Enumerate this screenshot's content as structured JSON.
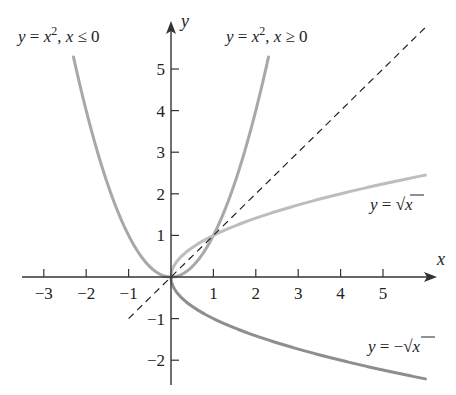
{
  "chart_data": {
    "type": "line",
    "title": "",
    "xlabel": "x",
    "ylabel": "y",
    "xlim": [
      -3.5,
      6.3
    ],
    "ylim": [
      -2.6,
      6.0
    ],
    "x_ticks": [
      -3,
      -2,
      -1,
      1,
      2,
      3,
      4,
      5
    ],
    "y_ticks": [
      -2,
      -1,
      1,
      2,
      3,
      4,
      5
    ],
    "grid": false,
    "legend": "none (inline curve labels)",
    "series": [
      {
        "name": "y = x^2, x ≤ 0",
        "label": "y = x², x ≤ 0",
        "style": "solid",
        "color": "#a8a8a8",
        "x": [
          -2.3,
          -2.0,
          -1.5,
          -1.0,
          -0.5,
          0
        ],
        "values": [
          5.29,
          4.0,
          2.25,
          1.0,
          0.25,
          0
        ]
      },
      {
        "name": "y = x^2, x ≥ 0",
        "label": "y = x², x ≥ 0",
        "style": "solid",
        "color": "#a8a8a8",
        "x": [
          0,
          0.5,
          1.0,
          1.5,
          2.0,
          2.3
        ],
        "values": [
          0,
          0.25,
          1.0,
          2.25,
          4.0,
          5.29
        ]
      },
      {
        "name": "y = sqrt(x)",
        "label": "y = √x",
        "style": "solid",
        "color": "#bdbdbd",
        "x": [
          0,
          0.25,
          1,
          2,
          3,
          4,
          5,
          6
        ],
        "values": [
          0,
          0.5,
          1.0,
          1.41,
          1.73,
          2.0,
          2.24,
          2.45
        ]
      },
      {
        "name": "y = -sqrt(x)",
        "label": "y = −√x",
        "style": "solid",
        "color": "#8e8e8e",
        "x": [
          0,
          0.25,
          1,
          2,
          3,
          4,
          5,
          6
        ],
        "values": [
          0,
          -0.5,
          -1.0,
          -1.41,
          -1.73,
          -2.0,
          -2.24,
          -2.45
        ]
      },
      {
        "name": "y = x",
        "label": "",
        "style": "dashed",
        "color": "#222222",
        "x": [
          -1,
          6
        ],
        "values": [
          -1,
          6
        ]
      }
    ]
  },
  "labels": {
    "x_axis": "x",
    "y_axis": "y",
    "x_ticks": [
      "−3",
      "−2",
      "−1",
      "1",
      "2",
      "3",
      "4",
      "5"
    ],
    "y_ticks": [
      "5",
      "4",
      "3",
      "2",
      "1",
      "−1",
      "−2"
    ],
    "curve_left": {
      "prefix": "y = x",
      "sup": "2",
      "suffix_sep": ", ",
      "cond_var": "x",
      "cond": " ≤ 0"
    },
    "curve_right": {
      "prefix": "y = x",
      "sup": "2",
      "suffix_sep": ", ",
      "cond_var": "x",
      "cond": " ≥ 0"
    },
    "curve_sqrt": {
      "y": "y",
      "eq": " = √",
      "x": "x"
    },
    "curve_neg_sqrt": {
      "y": "y",
      "eq": " = −√",
      "x": "x"
    }
  },
  "colors": {
    "axis": "#333333",
    "parabola": "#a8a8a8",
    "sqrt": "#bdbdbd",
    "neg_sqrt": "#8e8e8e",
    "identity": "#222222"
  }
}
